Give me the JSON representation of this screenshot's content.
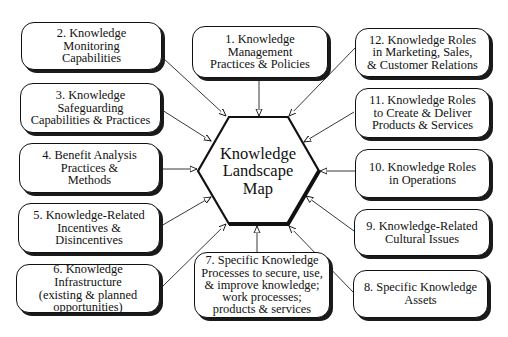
{
  "diagram": {
    "center": {
      "label": "Knowledge\nLandscape\nMap",
      "shape": "hexagon"
    },
    "nodes": [
      {
        "id": 1,
        "label": "1. Knowledge\nManagement\nPractices & Policies"
      },
      {
        "id": 2,
        "label": "2. Knowledge\nMonitoring\nCapabilities"
      },
      {
        "id": 3,
        "label": "3. Knowledge\nSafeguarding\nCapabilities & Practices"
      },
      {
        "id": 4,
        "label": "4. Benefit Analysis\nPractices &\nMethods"
      },
      {
        "id": 5,
        "label": "5. Knowledge-Related\nIncentives &\nDisincentives"
      },
      {
        "id": 6,
        "label": "6. Knowledge Infrastructure\n(existing & planned\nopportunities)"
      },
      {
        "id": 7,
        "label": "7. Specific Knowledge\nProcesses to secure, use,\n& improve knowledge;\nwork processes;\nproducts & services"
      },
      {
        "id": 8,
        "label": "8. Specific Knowledge\nAssets"
      },
      {
        "id": 9,
        "label": "9. Knowledge-Related\nCultural Issues"
      },
      {
        "id": 10,
        "label": "10. Knowledge Roles\nin Operations"
      },
      {
        "id": 11,
        "label": "11. Knowledge Roles\nto Create & Deliver\nProducts & Services"
      },
      {
        "id": 12,
        "label": "12. Knowledge Roles\nin Marketing, Sales,\n& Customer Relations"
      }
    ],
    "edges": [
      {
        "from": 1,
        "to": "center"
      },
      {
        "from": 2,
        "to": "center"
      },
      {
        "from": 3,
        "to": "center"
      },
      {
        "from": 4,
        "to": "center"
      },
      {
        "from": 5,
        "to": "center"
      },
      {
        "from": 6,
        "to": "center"
      },
      {
        "from": 7,
        "to": "center"
      },
      {
        "from": 8,
        "to": "center"
      },
      {
        "from": 9,
        "to": "center"
      },
      {
        "from": 10,
        "to": "center"
      },
      {
        "from": 11,
        "to": "center"
      },
      {
        "from": 12,
        "to": "center"
      }
    ],
    "colors": {
      "stroke": "#111111",
      "background": "#ffffff"
    }
  }
}
